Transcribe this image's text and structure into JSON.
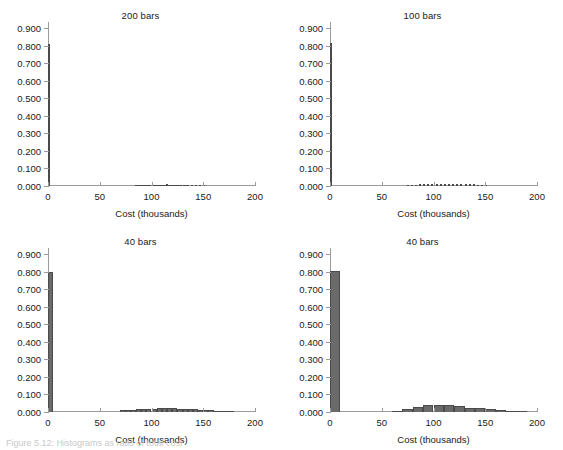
{
  "figure": {
    "caption_partial": "Figure 5.12: Histograms as ratio of total cost",
    "bar_color": "#6a6a6a",
    "axis_color": "#9a9a9a",
    "text_color": "#1a1a1a"
  },
  "chart_data": [
    {
      "type": "bar",
      "title": "200 bars",
      "xlabel": "Cost (thousands)",
      "ylabel": "",
      "xlim": [
        0,
        200
      ],
      "ylim": [
        0.0,
        0.9
      ],
      "xticks": [
        0,
        50,
        100,
        150,
        200
      ],
      "ytick_labels": [
        "0.000",
        "0.100",
        "0.200",
        "0.300",
        "0.400",
        "0.500",
        "0.600",
        "0.700",
        "0.800",
        "0.900"
      ],
      "yticks": [
        0.0,
        0.1,
        0.2,
        0.3,
        0.4,
        0.5,
        0.6,
        0.7,
        0.8,
        0.9
      ],
      "grid": false,
      "bin_width": 1.0,
      "bins": [
        {
          "x": 0.5,
          "value": 0.81
        },
        {
          "x": 84.5,
          "value": 0.003
        },
        {
          "x": 86.5,
          "value": 0.004
        },
        {
          "x": 88.5,
          "value": 0.003
        },
        {
          "x": 90.5,
          "value": 0.005
        },
        {
          "x": 92.5,
          "value": 0.004
        },
        {
          "x": 94.5,
          "value": 0.006
        },
        {
          "x": 96.5,
          "value": 0.005
        },
        {
          "x": 98.5,
          "value": 0.007
        },
        {
          "x": 100.5,
          "value": 0.006
        },
        {
          "x": 102.5,
          "value": 0.008
        },
        {
          "x": 104.5,
          "value": 0.005
        },
        {
          "x": 106.5,
          "value": 0.007
        },
        {
          "x": 108.5,
          "value": 0.006
        },
        {
          "x": 110.5,
          "value": 0.008
        },
        {
          "x": 112.5,
          "value": 0.007
        },
        {
          "x": 114.5,
          "value": 0.009
        },
        {
          "x": 116.5,
          "value": 0.007
        },
        {
          "x": 118.5,
          "value": 0.008
        },
        {
          "x": 120.5,
          "value": 0.006
        },
        {
          "x": 122.5,
          "value": 0.007
        },
        {
          "x": 124.5,
          "value": 0.005
        },
        {
          "x": 126.5,
          "value": 0.006
        },
        {
          "x": 128.5,
          "value": 0.004
        },
        {
          "x": 130.5,
          "value": 0.005
        },
        {
          "x": 132.5,
          "value": 0.004
        },
        {
          "x": 134.5,
          "value": 0.003
        },
        {
          "x": 138.5,
          "value": 0.003
        },
        {
          "x": 142.5,
          "value": 0.002
        },
        {
          "x": 146.5,
          "value": 0.002
        },
        {
          "x": 150.5,
          "value": 0.002
        }
      ]
    },
    {
      "type": "bar",
      "title": "100 bars",
      "xlabel": "Cost (thousands)",
      "ylabel": "",
      "xlim": [
        0,
        200
      ],
      "ylim": [
        0.0,
        0.9
      ],
      "xticks": [
        0,
        50,
        100,
        150,
        200
      ],
      "ytick_labels": [
        "0.000",
        "0.100",
        "0.200",
        "0.300",
        "0.400",
        "0.500",
        "0.600",
        "0.700",
        "0.800",
        "0.900"
      ],
      "yticks": [
        0.0,
        0.1,
        0.2,
        0.3,
        0.4,
        0.5,
        0.6,
        0.7,
        0.8,
        0.9
      ],
      "grid": false,
      "bin_width": 2.0,
      "bins": [
        {
          "x": 1,
          "value": 0.812
        },
        {
          "x": 75,
          "value": 0.004
        },
        {
          "x": 79,
          "value": 0.006
        },
        {
          "x": 83,
          "value": 0.007
        },
        {
          "x": 87,
          "value": 0.009
        },
        {
          "x": 91,
          "value": 0.01
        },
        {
          "x": 95,
          "value": 0.012
        },
        {
          "x": 99,
          "value": 0.011
        },
        {
          "x": 103,
          "value": 0.013
        },
        {
          "x": 107,
          "value": 0.012
        },
        {
          "x": 111,
          "value": 0.014
        },
        {
          "x": 115,
          "value": 0.013
        },
        {
          "x": 119,
          "value": 0.014
        },
        {
          "x": 123,
          "value": 0.012
        },
        {
          "x": 127,
          "value": 0.013
        },
        {
          "x": 131,
          "value": 0.011
        },
        {
          "x": 135,
          "value": 0.01
        },
        {
          "x": 139,
          "value": 0.009
        },
        {
          "x": 143,
          "value": 0.007
        },
        {
          "x": 147,
          "value": 0.006
        },
        {
          "x": 151,
          "value": 0.004
        }
      ]
    },
    {
      "type": "bar",
      "title": "40 bars",
      "xlabel": "Cost (thousands)",
      "ylabel": "",
      "xlim": [
        0,
        200
      ],
      "ylim": [
        0.0,
        0.9
      ],
      "xticks": [
        0,
        50,
        100,
        150,
        200
      ],
      "ytick_labels": [
        "0.000",
        "0.100",
        "0.200",
        "0.300",
        "0.400",
        "0.500",
        "0.600",
        "0.700",
        "0.800",
        "0.900"
      ],
      "yticks": [
        0.0,
        0.1,
        0.2,
        0.3,
        0.4,
        0.5,
        0.6,
        0.7,
        0.8,
        0.9
      ],
      "grid": false,
      "bin_width": 5.0,
      "bins": [
        {
          "x": 2.5,
          "value": 0.8
        },
        {
          "x": 72.5,
          "value": 0.009
        },
        {
          "x": 77.5,
          "value": 0.012
        },
        {
          "x": 82.5,
          "value": 0.014
        },
        {
          "x": 87.5,
          "value": 0.016
        },
        {
          "x": 92.5,
          "value": 0.018
        },
        {
          "x": 97.5,
          "value": 0.019
        },
        {
          "x": 102.5,
          "value": 0.02
        },
        {
          "x": 107.5,
          "value": 0.021
        },
        {
          "x": 112.5,
          "value": 0.021
        },
        {
          "x": 117.5,
          "value": 0.024
        },
        {
          "x": 122.5,
          "value": 0.022
        },
        {
          "x": 127.5,
          "value": 0.019
        },
        {
          "x": 132.5,
          "value": 0.018
        },
        {
          "x": 137.5,
          "value": 0.016
        },
        {
          "x": 142.5,
          "value": 0.015
        },
        {
          "x": 147.5,
          "value": 0.013
        },
        {
          "x": 152.5,
          "value": 0.012
        },
        {
          "x": 157.5,
          "value": 0.01
        },
        {
          "x": 162.5,
          "value": 0.007
        },
        {
          "x": 167.5,
          "value": 0.006
        },
        {
          "x": 172.5,
          "value": 0.005
        },
        {
          "x": 177.5,
          "value": 0.004
        }
      ]
    },
    {
      "type": "bar",
      "title": "40 bars",
      "xlabel": "Cost (thousands)",
      "ylabel": "",
      "xlim": [
        0,
        200
      ],
      "ylim": [
        0.0,
        0.9
      ],
      "xticks": [
        0,
        50,
        100,
        150,
        200
      ],
      "ytick_labels": [
        "0.000",
        "0.100",
        "0.200",
        "0.300",
        "0.400",
        "0.500",
        "0.600",
        "0.700",
        "0.800",
        "0.900"
      ],
      "yticks": [
        0.0,
        0.1,
        0.2,
        0.3,
        0.4,
        0.5,
        0.6,
        0.7,
        0.8,
        0.9
      ],
      "grid": false,
      "bin_width": 10.0,
      "bins": [
        {
          "x": 5,
          "value": 0.803
        },
        {
          "x": 65,
          "value": 0.006
        },
        {
          "x": 75,
          "value": 0.016
        },
        {
          "x": 85,
          "value": 0.026
        },
        {
          "x": 95,
          "value": 0.04
        },
        {
          "x": 105,
          "value": 0.038
        },
        {
          "x": 115,
          "value": 0.039
        },
        {
          "x": 125,
          "value": 0.036
        },
        {
          "x": 135,
          "value": 0.023
        },
        {
          "x": 145,
          "value": 0.021
        },
        {
          "x": 155,
          "value": 0.018
        },
        {
          "x": 165,
          "value": 0.01
        },
        {
          "x": 175,
          "value": 0.008
        },
        {
          "x": 185,
          "value": 0.004
        }
      ]
    }
  ]
}
